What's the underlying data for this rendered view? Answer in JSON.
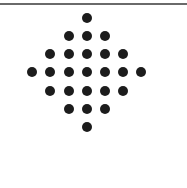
{
  "figure": {
    "rows": [
      1,
      3,
      5,
      7,
      5,
      3,
      1
    ],
    "total_dots": 25,
    "dot_color": "#1c1c1c",
    "rule_color": "#6a6a6a"
  }
}
